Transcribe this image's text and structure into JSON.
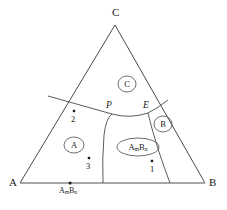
{
  "diagram": {
    "type": "ternary-phase-diagram",
    "title": "",
    "background_color": "#ffffff",
    "line_color": "#4a4a4a",
    "text_color": "#1a1a1a",
    "vertices": [
      {
        "id": "A",
        "label": "A",
        "x": 20,
        "y": 183,
        "label_x": 9,
        "label_y": 178
      },
      {
        "id": "B",
        "label": "B",
        "x": 205,
        "y": 183,
        "label_x": 209,
        "label_y": 178
      },
      {
        "id": "C",
        "label": "C",
        "x": 115,
        "y": 25,
        "label_x": 112,
        "label_y": 8
      }
    ],
    "phase_fields": [
      {
        "id": "field-A",
        "label": "A",
        "cx": 74,
        "cy": 145,
        "rx": 10,
        "ry": 8
      },
      {
        "id": "field-C",
        "label": "C",
        "cx": 127,
        "cy": 84,
        "rx": 9,
        "ry": 8
      },
      {
        "id": "field-B",
        "label": "B",
        "cx": 163,
        "cy": 124,
        "rx": 9,
        "ry": 8
      },
      {
        "id": "field-AmBn",
        "label": "A<sub>m</sub>B<sub>n</sub>",
        "cx": 138,
        "cy": 147,
        "rx": 21,
        "ry": 9
      }
    ],
    "invariant_points": [
      {
        "id": "P",
        "label": "P",
        "x": 112,
        "y": 114,
        "label_x": 106,
        "label_y": 103
      },
      {
        "id": "E",
        "label": "E",
        "x": 148,
        "y": 113,
        "label_x": 143,
        "label_y": 103
      }
    ],
    "composition_points": [
      {
        "id": "point-1",
        "label": "1",
        "dot_x": 152,
        "dot_y": 161,
        "label_x": 150,
        "label_y": 166
      },
      {
        "id": "point-2",
        "label": "2",
        "dot_x": 74,
        "dot_y": 111,
        "label_x": 72,
        "label_y": 116
      },
      {
        "id": "point-3",
        "label": "3",
        "dot_x": 89,
        "dot_y": 158,
        "label_x": 87,
        "label_y": 163
      }
    ],
    "compound_markers": [
      {
        "id": "compound-AmBn",
        "label": "A<sub>m</sub>B<sub>n</sub>",
        "dot_x": 70,
        "dot_y": 183,
        "label_x": 59,
        "label_y": 188
      }
    ],
    "boundaries": [
      {
        "id": "boundary-A-C",
        "description": "left liquidus boundary from AC edge to P"
      },
      {
        "id": "boundary-P-E",
        "description": "C field lower boundary from P to E"
      },
      {
        "id": "boundary-E-B",
        "description": "B field boundary from E to BC edge"
      },
      {
        "id": "boundary-P-base",
        "description": "A / AmBn boundary from P down to AB base"
      },
      {
        "id": "boundary-E-base",
        "description": "AmBn / B boundary from E down to AB base"
      }
    ]
  }
}
